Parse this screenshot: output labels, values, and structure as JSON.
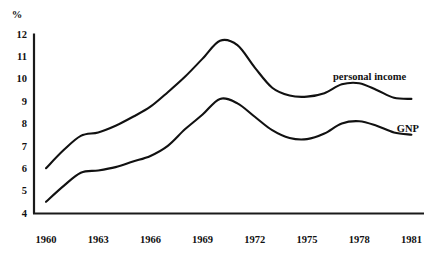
{
  "chart_data": {
    "type": "line",
    "title": "",
    "xlabel": "",
    "ylabel": "%",
    "unit_symbol": "%",
    "grid": false,
    "legend_position": "inline-right",
    "xlim": [
      1960,
      1981
    ],
    "ylim": [
      4,
      12
    ],
    "x_tick_labels": [
      "1960",
      "1963",
      "1966",
      "1969",
      "1972",
      "1975",
      "1978",
      "1981"
    ],
    "x_ticks": [
      1960,
      1963,
      1966,
      1969,
      1972,
      1975,
      1978,
      1981
    ],
    "y_tick_labels": [
      "4",
      "5",
      "6",
      "7",
      "8",
      "9",
      "10",
      "11",
      "12"
    ],
    "y_ticks": [
      4,
      5,
      6,
      7,
      8,
      9,
      10,
      11,
      12
    ],
    "x": [
      1960,
      1961,
      1962,
      1963,
      1964,
      1965,
      1966,
      1967,
      1968,
      1969,
      1970,
      1971,
      1972,
      1973,
      1974,
      1975,
      1976,
      1977,
      1978,
      1979,
      1980,
      1981
    ],
    "series": [
      {
        "name": "personal income",
        "label": "personal income",
        "color": "#111111",
        "values": [
          6.0,
          6.8,
          7.45,
          7.6,
          7.9,
          8.3,
          8.75,
          9.4,
          10.1,
          10.9,
          11.7,
          11.5,
          10.5,
          9.6,
          9.25,
          9.2,
          9.35,
          9.75,
          9.8,
          9.5,
          9.15,
          9.1
        ]
      },
      {
        "name": "GNP",
        "label": "GNP",
        "color": "#111111",
        "values": [
          4.5,
          5.2,
          5.8,
          5.9,
          6.05,
          6.3,
          6.55,
          7.0,
          7.75,
          8.4,
          9.1,
          8.9,
          8.3,
          7.7,
          7.35,
          7.3,
          7.55,
          8.0,
          8.1,
          7.9,
          7.6,
          7.5
        ]
      }
    ],
    "annotations": [
      {
        "name": "personal-income-label",
        "text": "personal income"
      },
      {
        "name": "gnp-label",
        "text": "GNP"
      }
    ]
  }
}
